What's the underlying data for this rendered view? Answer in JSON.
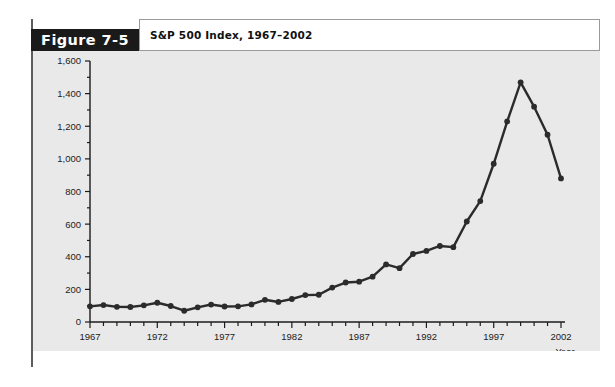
{
  "figure": {
    "tab_label": "Figure 7-5",
    "title": "S&P 500 Index, 1967–2002"
  },
  "chart_data": {
    "type": "line",
    "title": "S&P 500 Index, 1967–2002",
    "xlabel": "Year",
    "ylabel": "",
    "xlim": [
      1967,
      2002
    ],
    "ylim": [
      0,
      1600
    ],
    "grid": false,
    "legend": false,
    "line_color": "#2b2b2b",
    "marker": "circle",
    "x_tick_labels": [
      "1967",
      "1972",
      "1977",
      "1982",
      "1987",
      "1992",
      "1997",
      "2002"
    ],
    "x_major_ticks": [
      1967,
      1972,
      1977,
      1982,
      1987,
      1992,
      1997,
      2002
    ],
    "x_minor_tick_step": 1,
    "y_tick_labels": [
      "0",
      "200",
      "400",
      "600",
      "800",
      "1,000",
      "1,200",
      "1,400",
      "1,600"
    ],
    "y_major_ticks": [
      0,
      200,
      400,
      600,
      800,
      1000,
      1200,
      1400,
      1600
    ],
    "y_minor_tick_step": 100,
    "x": [
      1967,
      1968,
      1969,
      1970,
      1971,
      1972,
      1973,
      1974,
      1975,
      1976,
      1977,
      1978,
      1979,
      1980,
      1981,
      1982,
      1983,
      1984,
      1985,
      1986,
      1987,
      1988,
      1989,
      1990,
      1991,
      1992,
      1993,
      1994,
      1995,
      1996,
      1997,
      1998,
      1999,
      2000,
      2001,
      2002
    ],
    "values": [
      96,
      104,
      93,
      92,
      102,
      118,
      98,
      69,
      90,
      107,
      95,
      96,
      108,
      136,
      123,
      141,
      165,
      167,
      211,
      242,
      247,
      278,
      353,
      330,
      417,
      436,
      466,
      459,
      616,
      741,
      970,
      1229,
      1469,
      1320,
      1148,
      880
    ]
  }
}
